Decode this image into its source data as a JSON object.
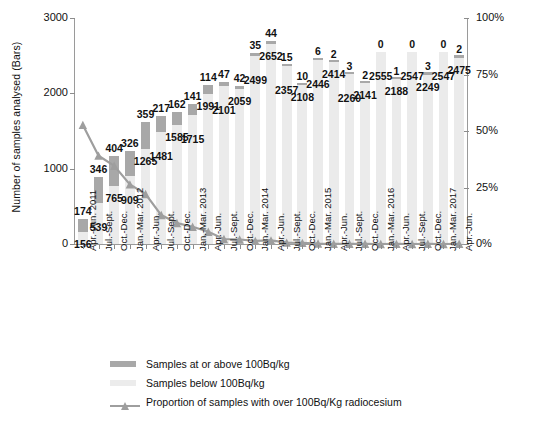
{
  "chart_data": {
    "type": "bar",
    "title": "",
    "subtitle": "",
    "xlabel": "",
    "ylabel": "Number of samples analysed (Bars)",
    "ylabel_right": "Percentage of samples at or above 100Bq/kg (green line)",
    "ylim": [
      0,
      3000
    ],
    "ylim_right": [
      0,
      100
    ],
    "yticks": [
      "0",
      "1000",
      "2000",
      "3000"
    ],
    "ytick_values": [
      0,
      1000,
      2000,
      3000
    ],
    "yticks_right": [
      "0%",
      "25%",
      "50%",
      "75%",
      "100%"
    ],
    "ytick_values_right": [
      0,
      25,
      50,
      75,
      100
    ],
    "grid": false,
    "legend_position": "bottom",
    "stacked": true,
    "categories": [
      "Apr.-Jun. 2011",
      "Jul.-Sept.",
      "Oct.-Dec.",
      "Jan.-Mar. 2012",
      "Apr.-Jun.",
      "Jul.-Sept.",
      "Oct.-Dec.",
      "Jan.-Mar. 2013",
      "Apr.-Jun.",
      "Jul.-Sept.",
      "Oct.-Dec.",
      "Jan.-Mar. 2014",
      "Apr.-Jun.",
      "Jul.-Sept.",
      "Oct.-Dec.",
      "Jan.-Mar. 2015",
      "Apr.-Jun.",
      "Jul.-Sept.",
      "Oct.-Dec.",
      "Jan.-Mar. 2016",
      "Apr.-Jun.",
      "Jul.-Sept.",
      "Oct.-Dec.",
      "Jan.-Mar. 2017",
      "Apr.-Jun."
    ],
    "series": [
      {
        "name": "Samples below 100Bq/kg",
        "color": "#ebebeb",
        "values": [
          156,
          539,
          765,
          909,
          1265,
          1481,
          1585,
          1715,
          1991,
          2101,
          2059,
          2499,
          2652,
          2357,
          2108,
          2446,
          2414,
          2260,
          2141,
          2555,
          2188,
          2547,
          2249,
          2547,
          2475
        ]
      },
      {
        "name": "Samples at or above 100Bq/kg",
        "color": "#a8a8a8",
        "values": [
          174,
          346,
          404,
          326,
          359,
          217,
          162,
          141,
          114,
          47,
          42,
          35,
          44,
          15,
          10,
          6,
          2,
          3,
          2,
          0,
          1,
          0,
          3,
          0,
          2
        ]
      },
      {
        "name": "Proportion of samples with over 100Bq/Kg radiocesium",
        "color": "#9e9e9e",
        "axis": "right",
        "unit": "%",
        "values": [
          52.7,
          39.1,
          34.6,
          26.4,
          22.1,
          12.8,
          9.3,
          7.6,
          5.4,
          2.2,
          2.0,
          1.4,
          1.6,
          0.6,
          0.5,
          0.2,
          0.1,
          0.1,
          0.1,
          0.0,
          0.05,
          0.0,
          0.1,
          0.0,
          0.1
        ]
      }
    ],
    "legend": [
      {
        "label": "Samples at or above 100Bq/kg",
        "marker": "swatch-dark"
      },
      {
        "label": "Samples below 100Bq/kg",
        "marker": "swatch-light"
      },
      {
        "label": "Proportion of samples with over 100Bq/Kg radiocesium",
        "marker": "line-with-triangle"
      }
    ]
  },
  "colors": {
    "bar_above": "#a8a8a8",
    "bar_below": "#ebebeb",
    "line": "#9e9e9e",
    "axis": "#9a9a9a",
    "text": "#111111",
    "background": "#ffffff"
  }
}
